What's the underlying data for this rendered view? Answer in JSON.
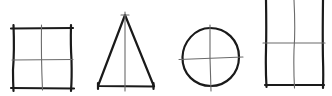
{
  "diagram": {
    "colors": {
      "outline": "#1a1a1a",
      "guide": "#6a6a6a",
      "background": "#ffffff"
    },
    "shapes": [
      {
        "name": "square",
        "guides": [
          "vertical-center",
          "horizontal-center"
        ]
      },
      {
        "name": "triangle",
        "guides": [
          "vertical-center"
        ]
      },
      {
        "name": "circle",
        "guides": [
          "vertical-center",
          "horizontal-center"
        ]
      },
      {
        "name": "tall-rectangle",
        "guides": [
          "vertical-center",
          "horizontal-center"
        ]
      }
    ]
  }
}
